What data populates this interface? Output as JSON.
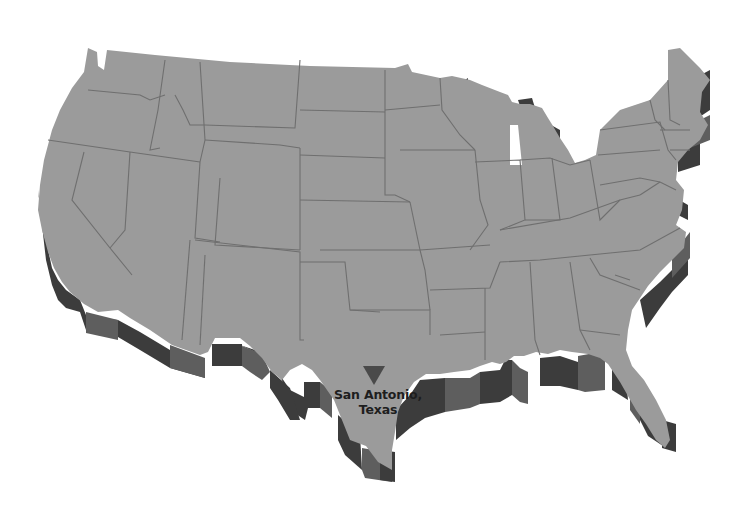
{
  "map": {
    "title": "United States",
    "style": "3D extruded grayscale",
    "colors": {
      "surface": "#9b9b9b",
      "border": "#6f6f6f",
      "wall_dark": "#3c3c3c",
      "wall_mid": "#5e5e5e",
      "background": "#ffffff",
      "marker": "#4a4a4a",
      "label": "#1e1e1e"
    },
    "marker": {
      "icon": "inverted-triangle-icon",
      "location": "San Antonio, Texas",
      "x": 373,
      "y": 375
    },
    "label": {
      "line1": "San Antonio,",
      "line2": "Texas"
    }
  }
}
